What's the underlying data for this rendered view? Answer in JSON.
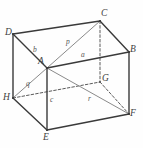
{
  "figure": {
    "type": "geometry-diagram",
    "canvas": {
      "width": 143,
      "height": 148
    },
    "colors": {
      "background": "#fefefe",
      "solid_edge": "#3a3a3a",
      "hidden_edge": "#5a5a5a",
      "diagonal": "#8a8a8a",
      "label": "#4a4a4a"
    },
    "vertices": [
      {
        "name": "D",
        "label": "D",
        "x": 13,
        "y": 34,
        "lx": 5,
        "ly": 28,
        "hidden": false
      },
      {
        "name": "C",
        "label": "C",
        "x": 100,
        "y": 21,
        "lx": 101,
        "ly": 9,
        "hidden": false
      },
      {
        "name": "B",
        "label": "B",
        "x": 129,
        "y": 52,
        "lx": 130,
        "ly": 45,
        "hidden": false
      },
      {
        "name": "A",
        "label": "A",
        "x": 47,
        "y": 68,
        "lx": 38,
        "ly": 57,
        "hidden": false
      },
      {
        "name": "G",
        "label": "G",
        "x": 100,
        "y": 82,
        "lx": 102,
        "ly": 74,
        "hidden": true
      },
      {
        "name": "H",
        "label": "H",
        "x": 13,
        "y": 98,
        "lx": 3,
        "ly": 93,
        "hidden": false
      },
      {
        "name": "E",
        "label": "E",
        "x": 47,
        "y": 130,
        "lx": 43,
        "ly": 133,
        "hidden": false
      },
      {
        "name": "F",
        "label": "F",
        "x": 129,
        "y": 114,
        "lx": 130,
        "ly": 109,
        "hidden": false
      }
    ],
    "solid_edges": [
      {
        "name": "D-C",
        "from": "D",
        "to": "C"
      },
      {
        "name": "C-B",
        "from": "C",
        "to": "B"
      },
      {
        "name": "D-A",
        "from": "D",
        "to": "A"
      },
      {
        "name": "A-B",
        "from": "A",
        "to": "B"
      },
      {
        "name": "D-H",
        "from": "D",
        "to": "H"
      },
      {
        "name": "B-F",
        "from": "B",
        "to": "F"
      },
      {
        "name": "A-E",
        "from": "A",
        "to": "E"
      },
      {
        "name": "H-E",
        "from": "H",
        "to": "E"
      },
      {
        "name": "E-F",
        "from": "E",
        "to": "F"
      }
    ],
    "hidden_edges": [
      {
        "name": "C-G",
        "from": "C",
        "to": "G"
      },
      {
        "name": "H-G",
        "from": "H",
        "to": "G"
      },
      {
        "name": "G-F",
        "from": "G",
        "to": "F"
      }
    ],
    "diagonals": [
      {
        "name": "A-C",
        "from": "A",
        "to": "C",
        "label": "p"
      },
      {
        "name": "A-H",
        "from": "A",
        "to": "H",
        "label": "q"
      },
      {
        "name": "A-F",
        "from": "A",
        "to": "F",
        "label": "r"
      }
    ],
    "edge_labels": [
      {
        "name": "edge-label-b",
        "label": "b",
        "x": 33,
        "y": 46
      },
      {
        "name": "edge-label-a",
        "label": "a",
        "x": 81,
        "y": 51
      },
      {
        "name": "edge-label-c",
        "label": "c",
        "x": 50,
        "y": 96
      },
      {
        "name": "diagonal-label-p",
        "label": "p",
        "x": 66,
        "y": 38
      },
      {
        "name": "diagonal-label-q",
        "label": "q",
        "x": 26,
        "y": 80
      },
      {
        "name": "diagonal-label-r",
        "label": "r",
        "x": 88,
        "y": 95
      }
    ]
  }
}
